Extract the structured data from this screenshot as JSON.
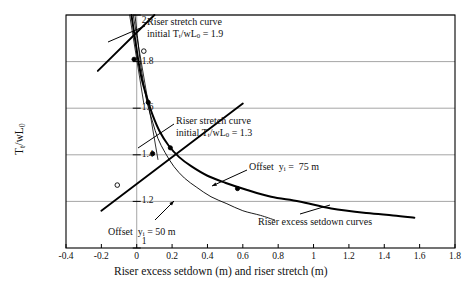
{
  "chart_data": {
    "type": "line",
    "title": "",
    "xlabel": "Riser excess setdown (m) and riser stretch (m)",
    "ylabel": "Tₜ/wL₀",
    "xlim": [
      -0.4,
      1.8
    ],
    "ylim": [
      1.0,
      2.0
    ],
    "xticks": [
      "-0.4",
      "-0.2",
      "0",
      "0.2",
      "0.4",
      "0.6",
      "0.8",
      "1",
      "1.2",
      "1.4",
      "1.6",
      "1.8"
    ],
    "xtick_values": [
      -0.4,
      -0.2,
      0,
      0.2,
      0.4,
      0.6,
      0.8,
      1.0,
      1.2,
      1.4,
      1.6,
      1.8
    ],
    "yticks": [
      "1",
      "1.2",
      "1.4",
      "1.6",
      "1.8",
      "2"
    ],
    "ytick_values": [
      1.0,
      1.2,
      1.4,
      1.6,
      1.8,
      2.0
    ],
    "grid": "horizontal-and-vertical-at-zero",
    "legend": "none (inline annotations)",
    "series": [
      {
        "name": "Riser excess setdown curve, offset yᵢ = 75 m",
        "style": "thick-solid",
        "points": [
          [
            -0.03,
            2.0
          ],
          [
            -0.01,
            1.9
          ],
          [
            0.01,
            1.8
          ],
          [
            0.03,
            1.72
          ],
          [
            0.06,
            1.64
          ],
          [
            0.09,
            1.57
          ],
          [
            0.13,
            1.5
          ],
          [
            0.18,
            1.44
          ],
          [
            0.24,
            1.39
          ],
          [
            0.31,
            1.35
          ],
          [
            0.4,
            1.31
          ],
          [
            0.5,
            1.28
          ],
          [
            0.62,
            1.25
          ],
          [
            0.76,
            1.22
          ],
          [
            0.92,
            1.2
          ],
          [
            1.1,
            1.17
          ],
          [
            1.3,
            1.15
          ],
          [
            1.45,
            1.14
          ],
          [
            1.57,
            1.13
          ]
        ]
      },
      {
        "name": "Riser excess setdown curve, offset yᵢ = 50 m",
        "style": "thin-solid",
        "points": [
          [
            -0.01,
            2.0
          ],
          [
            0.005,
            1.9
          ],
          [
            0.02,
            1.8
          ],
          [
            0.04,
            1.7
          ],
          [
            0.06,
            1.62
          ],
          [
            0.09,
            1.54
          ],
          [
            0.12,
            1.47
          ],
          [
            0.16,
            1.41
          ],
          [
            0.21,
            1.35
          ],
          [
            0.27,
            1.3
          ],
          [
            0.34,
            1.26
          ],
          [
            0.42,
            1.22
          ],
          [
            0.51,
            1.19
          ],
          [
            0.6,
            1.16
          ],
          [
            0.7,
            1.14
          ],
          [
            0.78,
            1.12
          ]
        ]
      },
      {
        "name": "Riser stretch curve, initial Tₜ/wL₀ = 1.9",
        "style": "thick-straight",
        "points": [
          [
            -0.22,
            1.76
          ],
          [
            0.1,
            2.0
          ]
        ]
      },
      {
        "name": "Riser stretch curve, initial Tₜ/wL₀ = 1.3",
        "style": "thick-straight",
        "points": [
          [
            -0.2,
            1.16
          ],
          [
            0.6,
            1.62
          ]
        ]
      },
      {
        "name": "Riser stretch curve thin (50 m), initial Tₜ/wL₀ = 1.9",
        "style": "thin-straight",
        "points": [
          [
            -0.04,
            2.0
          ],
          [
            0.04,
            1.62
          ]
        ]
      },
      {
        "name": "Riser stretch curve thin (50 m), initial Tₜ/wL₀ = 1.3",
        "style": "thin-straight",
        "points": [
          [
            -0.02,
            2.0
          ],
          [
            0.12,
            1.38
          ]
        ]
      }
    ],
    "markers": [
      {
        "x": 0.04,
        "y": 1.845,
        "type": "open-circle",
        "label": "intersection 1.9 / 50 m"
      },
      {
        "x": -0.015,
        "y": 1.81,
        "type": "filled-dot",
        "label": "intersection 1.9 / 75 m"
      },
      {
        "x": 0.065,
        "y": 1.625,
        "type": "filled-dot",
        "label": "intersection"
      },
      {
        "x": 0.09,
        "y": 1.405,
        "type": "filled-dot",
        "label": "intersection 1.3 / 50 m"
      },
      {
        "x": 0.19,
        "y": 1.43,
        "type": "filled-dot",
        "label": "intersection 1.3 / 75 m"
      },
      {
        "x": -0.11,
        "y": 1.27,
        "type": "open-circle",
        "label": "marker on 1.3 stretch line"
      },
      {
        "x": 0.57,
        "y": 1.255,
        "type": "filled-dot",
        "label": "offset 75 m callout anchor"
      }
    ],
    "annotations": [
      {
        "id": "stretch-19",
        "line1": "Riser stretch curve",
        "line2": "initial Tₜ/wL₀ = 1.9"
      },
      {
        "id": "stretch-13",
        "line1": "Riser stretch curve",
        "line2": "initial Tₜ/wL₀ = 1.3"
      },
      {
        "id": "offset-75",
        "text": "Offset  yᵢ =  75 m"
      },
      {
        "id": "offset-50",
        "text": "Offset  yᵢ = 50 m"
      },
      {
        "id": "setdown-curves",
        "text": "Riser excess setdown curves"
      }
    ],
    "colors": {
      "axis": "#000000",
      "grid": "#808080",
      "curve": "#000000",
      "background": "#ffffff"
    }
  }
}
